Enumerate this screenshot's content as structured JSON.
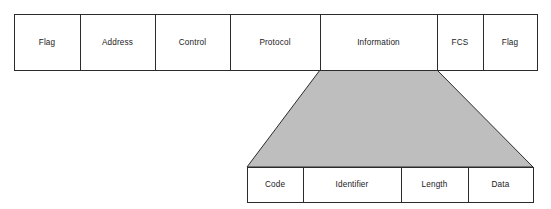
{
  "diagram": {
    "colors": {
      "outline": "#2b2b2b",
      "fill_white": "#ffffff",
      "fill_gray": "#bebebe",
      "text": "#1a1a1a"
    },
    "frame_row": {
      "name": "ppp-frame-fields",
      "fields": [
        {
          "label": "Flag",
          "x": 14,
          "width": 66
        },
        {
          "label": "Address",
          "x": 80,
          "width": 75
        },
        {
          "label": "Control",
          "x": 155,
          "width": 75
        },
        {
          "label": "Protocol",
          "x": 230,
          "width": 90
        },
        {
          "label": "Information",
          "x": 320,
          "width": 117
        },
        {
          "label": "FCS",
          "x": 437,
          "width": 46
        },
        {
          "label": "Flag",
          "x": 483,
          "width": 54
        }
      ],
      "y": 14,
      "height": 56
    },
    "expansion": {
      "name": "information-field-expansion",
      "top_left_x": 320,
      "top_right_x": 437,
      "top_y": 70,
      "bottom_left_x": 247,
      "bottom_right_x": 533,
      "bottom_y": 167
    },
    "packet_row": {
      "name": "lcp-packet-fields",
      "fields": [
        {
          "label": "Code",
          "x": 247,
          "width": 56
        },
        {
          "label": "Identifier",
          "x": 303,
          "width": 98
        },
        {
          "label": "Length",
          "x": 401,
          "width": 67
        },
        {
          "label": "Data",
          "x": 468,
          "width": 65
        }
      ],
      "y": 167,
      "height": 35
    }
  }
}
